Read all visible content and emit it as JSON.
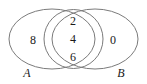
{
  "figure": {
    "type": "venn-diagram",
    "background_color": "#ffffff",
    "outline_color": "#7b7b7b",
    "text_color": "#1a1a1a"
  },
  "sets": {
    "left": {
      "name": "set-a",
      "label": "A",
      "elements": [
        "8"
      ]
    },
    "right": {
      "name": "set-b",
      "label": "B",
      "elements": [
        "0"
      ]
    },
    "intersection": {
      "name": "set-a-intersect-b",
      "elements": [
        "2",
        "4",
        "6"
      ]
    }
  },
  "regions": {
    "a_only": {
      "values": [
        "8"
      ]
    },
    "intersection": {
      "values": [
        "2",
        "4",
        "6"
      ]
    },
    "b_only": {
      "values": [
        "0"
      ]
    }
  }
}
